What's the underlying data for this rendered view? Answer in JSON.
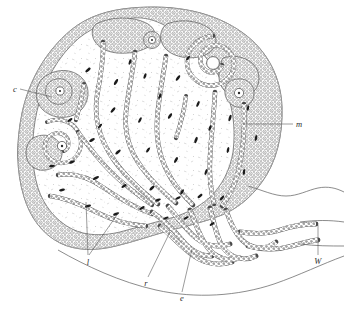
{
  "figure": {
    "type": "histological-section-drawing",
    "background_color": "#ffffff",
    "ink_color": "#4f4f4f",
    "nucleus_color": "#1b1b1b",
    "width": 346,
    "height": 317
  },
  "labels": [
    {
      "id": "c",
      "text": "c",
      "x": 13,
      "y": 92,
      "anchor": "start",
      "leader": [
        [
          20,
          89
        ],
        [
          52,
          97
        ]
      ]
    },
    {
      "id": "m",
      "text": "m",
      "x": 296,
      "y": 127,
      "anchor": "start",
      "leader": [
        [
          293,
          124
        ],
        [
          243,
          124
        ]
      ]
    },
    {
      "id": "l",
      "text": "l",
      "x": 88,
      "y": 262,
      "anchor": "middle",
      "leader": [
        [
          88,
          255
        ],
        [
          86,
          202
        ]
      ]
    },
    {
      "id": "l2",
      "text": "",
      "x": 88,
      "y": 262,
      "anchor": "middle",
      "leader": [
        [
          89,
          255
        ],
        [
          119,
          212
        ]
      ]
    },
    {
      "id": "r",
      "text": "r",
      "x": 146,
      "y": 285,
      "anchor": "middle",
      "leader": [
        [
          148,
          277
        ],
        [
          170,
          232
        ]
      ]
    },
    {
      "id": "e",
      "text": "e",
      "x": 182,
      "y": 300,
      "anchor": "middle",
      "leader": [
        [
          182,
          292
        ],
        [
          192,
          249
        ]
      ]
    },
    {
      "id": "W",
      "text": "W",
      "x": 318,
      "y": 263,
      "anchor": "middle",
      "leader": [
        [
          318,
          255
        ],
        [
          318,
          228
        ]
      ]
    }
  ],
  "legend_note": {
    "c": "cortical acinar lobule (secretory end-piece)",
    "m": "marginal epithelial wall of the gland body",
    "l": "lumen of coiled secretory tubule",
    "r": "convoluted duct region at gland base",
    "e": "excretory duct epithelium",
    "W": "surface / wall of the integument"
  },
  "structures": {
    "organ_outline_label": "gland capsule outline",
    "epithelial_rim_label": "stratified epithelial rim",
    "acini_label": "secretory acinus",
    "spiral_label": "coiled tubule in section",
    "duct_network_label": "branching duct network",
    "efferent_duct_label": "efferent duct to surface",
    "skin_contour_label": "integument contour line"
  }
}
